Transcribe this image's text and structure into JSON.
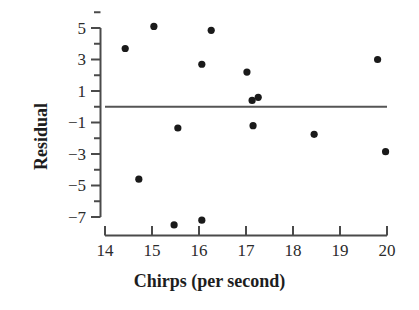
{
  "chart_data": {
    "type": "scatter",
    "title": "",
    "xlabel": "Chirps (per second)",
    "ylabel": "Residual",
    "xlim": [
      13.75,
      20.35
    ],
    "ylim": [
      -7.9,
      5.85
    ],
    "grid": false,
    "legend": null,
    "xticks": [
      14,
      15,
      16,
      17,
      18,
      19,
      20
    ],
    "xtick_labels": [
      "14",
      "15",
      "16",
      "17",
      "18",
      "19",
      "20"
    ],
    "yticks": [
      5,
      3,
      1,
      -1,
      -3,
      -5,
      -7
    ],
    "ytick_labels": [
      "5",
      "3",
      "1",
      "−1",
      "−3",
      "−5",
      "−7"
    ],
    "yminor_ticks": [
      6,
      4,
      2,
      0,
      -2,
      -4,
      -6
    ],
    "reference_line": {
      "orientation": "horizontal",
      "y": 0,
      "x_start": 14.0,
      "x_end": 20.0
    },
    "x": [
      14.43,
      14.72,
      15.04,
      15.47,
      15.55,
      16.06,
      16.06,
      16.26,
      17.02,
      17.13,
      17.15,
      17.26,
      18.45,
      19.8,
      19.97
    ],
    "y": [
      3.7,
      -4.6,
      5.1,
      -7.5,
      -1.35,
      -7.2,
      2.7,
      4.85,
      2.2,
      0.4,
      -1.2,
      0.6,
      -1.75,
      3.0,
      -2.85
    ],
    "points": [
      {
        "x": 14.43,
        "y": 3.7
      },
      {
        "x": 14.72,
        "y": -4.6
      },
      {
        "x": 15.04,
        "y": 5.1
      },
      {
        "x": 15.47,
        "y": -7.5
      },
      {
        "x": 15.55,
        "y": -1.35
      },
      {
        "x": 16.06,
        "y": -7.2
      },
      {
        "x": 16.06,
        "y": 2.7
      },
      {
        "x": 16.26,
        "y": 4.85
      },
      {
        "x": 17.02,
        "y": 2.2
      },
      {
        "x": 17.13,
        "y": 0.4
      },
      {
        "x": 17.15,
        "y": -1.2
      },
      {
        "x": 17.26,
        "y": 0.6
      },
      {
        "x": 18.45,
        "y": -1.75
      },
      {
        "x": 19.8,
        "y": 3.0
      },
      {
        "x": 19.97,
        "y": -2.85
      }
    ],
    "marker": {
      "shape": "circle",
      "color": "#1a1a1a",
      "size": 4.6
    },
    "colors": {
      "marker": "#1a1a1a",
      "axis": "#4a4a4a",
      "reference_line": "#555555",
      "text": "#2b2b2b",
      "background": "#ffffff"
    }
  }
}
